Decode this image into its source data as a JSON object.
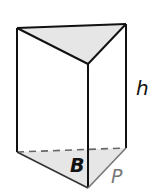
{
  "figure": {
    "type": "triangular-prism",
    "labels": {
      "height": "h",
      "base": "B",
      "perimeter": "P"
    },
    "colors": {
      "edge": "#111111",
      "hidden_edge": "#666666",
      "base_edge": "#777777",
      "face_fill": "#e6e6e6",
      "label": "#111111",
      "perimeter_label": "#777777"
    }
  }
}
